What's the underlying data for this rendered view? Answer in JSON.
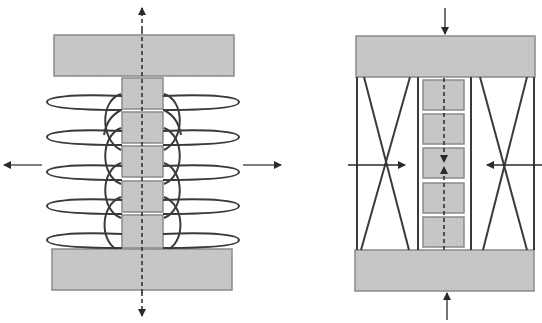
{
  "diagram": {
    "type": "schematic-comparison",
    "panels": [
      {
        "id": "left",
        "description": "Stack of five blocks between two plates, wrapped by five horizontal elliptical loops with arc links; dashed axis arrows pointing outward (up/down), side arrows pointing outward (left/right)",
        "plates": [
          {
            "name": "top-plate",
            "x": 54,
            "y": 35,
            "w": 180,
            "h": 41
          },
          {
            "name": "bottom-plate",
            "x": 52,
            "y": 249,
            "w": 180,
            "h": 41
          }
        ],
        "blocks": [
          {
            "x": 122,
            "y": 78,
            "w": 41,
            "h": 31
          },
          {
            "x": 122,
            "y": 112,
            "w": 41,
            "h": 31
          },
          {
            "x": 122,
            "y": 146,
            "w": 41,
            "h": 31
          },
          {
            "x": 122,
            "y": 181,
            "w": 41,
            "h": 31
          },
          {
            "x": 122,
            "y": 215,
            "w": 41,
            "h": 33
          }
        ],
        "loops_cy": [
          102,
          137,
          172,
          206,
          240
        ],
        "loop_rx": 96,
        "loop_ry": 8,
        "loop_cx": 143,
        "axis_x": 142,
        "arrows": {
          "up": {
            "x": 142,
            "from_y": 35,
            "to_y": 8,
            "dashed": true
          },
          "down": {
            "x": 142,
            "from_y": 290,
            "to_y": 316,
            "dashed": true
          },
          "left": {
            "y": 165,
            "from_x": 42,
            "to_x": 4
          },
          "right": {
            "y": 165,
            "from_x": 243,
            "to_x": 281
          }
        }
      },
      {
        "id": "right",
        "description": "Stack of five blocks in a central channel between two plates, flanked by two X-braced side frames; solid arrows pushing inward from top, bottom, left and right; dashed internal arrows converging at the centre",
        "plates": [
          {
            "name": "top-plate",
            "x": 356,
            "y": 36,
            "w": 179,
            "h": 41
          },
          {
            "name": "bottom-plate",
            "x": 355,
            "y": 250,
            "w": 179,
            "h": 41
          }
        ],
        "blocks": [
          {
            "x": 423,
            "y": 80,
            "w": 41,
            "h": 30
          },
          {
            "x": 423,
            "y": 114,
            "w": 41,
            "h": 30
          },
          {
            "x": 423,
            "y": 148,
            "w": 41,
            "h": 30
          },
          {
            "x": 423,
            "y": 183,
            "w": 41,
            "h": 30
          },
          {
            "x": 423,
            "y": 217,
            "w": 41,
            "h": 30
          }
        ],
        "axis_x": 444,
        "arrows": {
          "top": {
            "x": 445,
            "from_y": 8,
            "to_y": 34
          },
          "bottom": {
            "x": 447,
            "from_y": 320,
            "to_y": 293
          },
          "left": {
            "y": 165,
            "from_x": 348,
            "to_x": 405
          },
          "right": {
            "y": 165,
            "from_x": 542,
            "to_x": 487
          }
        }
      }
    ],
    "colors": {
      "plate_fill": "#c8c8c8",
      "plate_stroke": "#8a8a8a",
      "line": "#3a3a3a",
      "background": "#ffffff"
    }
  }
}
